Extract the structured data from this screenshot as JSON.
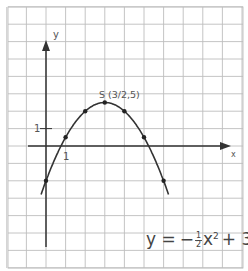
{
  "chart_data": {
    "type": "line",
    "title": "",
    "xlabel": "x",
    "ylabel": "y",
    "function": "y = -1/2 x^2 + 3x - 2",
    "x": [
      0,
      1,
      2,
      3,
      4,
      5,
      6
    ],
    "series": [
      {
        "name": "y = -1/2x^2 + 3x - 2",
        "values": [
          -2,
          0.5,
          2,
          2.5,
          2,
          0.5,
          -2
        ]
      }
    ],
    "vertex_label": "S (3/2,5)",
    "xlim": [
      -2,
      10
    ],
    "ylim": [
      -7,
      8
    ],
    "x_tick_label": "1",
    "y_tick_label": "1",
    "grid": true,
    "colors": {
      "curve": "#333333",
      "grid": "#b9b9b9",
      "axes": "#333333"
    }
  },
  "labels": {
    "x_axis": "x",
    "y_axis": "y",
    "x_tick": "1",
    "y_tick": "1",
    "vertex": "S (3/2,5)"
  },
  "equation": {
    "lhs": "y =",
    "minus": "−",
    "frac_num": "1",
    "frac_den": "2",
    "var": "x",
    "exp": "2",
    "rest": "+ 3x − 2"
  }
}
